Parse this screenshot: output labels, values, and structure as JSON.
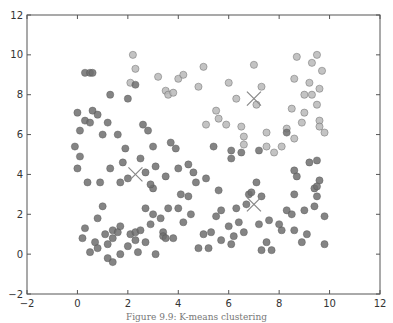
{
  "chart_data": {
    "type": "scatter",
    "title": "",
    "xlabel": "",
    "ylabel": "",
    "xlim": [
      -2,
      12
    ],
    "ylim": [
      -2,
      12
    ],
    "xticks": [
      -2,
      0,
      2,
      4,
      6,
      8,
      10,
      12
    ],
    "yticks": [
      -2,
      0,
      2,
      4,
      6,
      8,
      10,
      12
    ],
    "grid": false,
    "legend": null,
    "series": [
      {
        "name": "cluster-top-right",
        "color": "#b8b8b8",
        "points": [
          [
            2.2,
            10.0
          ],
          [
            2.3,
            9.3
          ],
          [
            2.1,
            8.6
          ],
          [
            3.2,
            8.9
          ],
          [
            3.5,
            8.2
          ],
          [
            3.6,
            8.0
          ],
          [
            4.0,
            8.8
          ],
          [
            4.2,
            9.0
          ],
          [
            3.8,
            8.1
          ],
          [
            5.0,
            9.4
          ],
          [
            4.8,
            8.4
          ],
          [
            5.1,
            6.5
          ],
          [
            5.5,
            7.2
          ],
          [
            5.6,
            6.8
          ],
          [
            5.9,
            6.5
          ],
          [
            6.0,
            8.6
          ],
          [
            6.3,
            7.8
          ],
          [
            6.5,
            6.4
          ],
          [
            6.6,
            5.9
          ],
          [
            6.6,
            5.5
          ],
          [
            7.0,
            9.5
          ],
          [
            7.1,
            7.5
          ],
          [
            7.3,
            8.4
          ],
          [
            7.5,
            6.1
          ],
          [
            7.5,
            5.4
          ],
          [
            7.8,
            5.1
          ],
          [
            8.3,
            6.3
          ],
          [
            8.5,
            7.3
          ],
          [
            8.6,
            8.8
          ],
          [
            8.7,
            9.9
          ],
          [
            8.9,
            6.6
          ],
          [
            9.0,
            8.0
          ],
          [
            9.0,
            7.1
          ],
          [
            9.2,
            8.6
          ],
          [
            9.3,
            9.6
          ],
          [
            9.3,
            8.0
          ],
          [
            9.5,
            7.5
          ],
          [
            9.6,
            8.3
          ],
          [
            9.6,
            6.7
          ],
          [
            9.7,
            9.2
          ],
          [
            9.6,
            6.4
          ],
          [
            9.8,
            6.1
          ],
          [
            8.6,
            5.8
          ],
          [
            8.1,
            5.4
          ],
          [
            9.5,
            10.0
          ]
        ]
      },
      {
        "name": "cluster-bottom-left",
        "color": "#6f6f6f",
        "points": [
          [
            0.3,
            9.1
          ],
          [
            0.5,
            9.1
          ],
          [
            0.6,
            9.1
          ],
          [
            2.3,
            8.5
          ],
          [
            1.3,
            8.0
          ],
          [
            2.0,
            7.8
          ],
          [
            0.0,
            7.1
          ],
          [
            0.6,
            7.2
          ],
          [
            0.8,
            7.0
          ],
          [
            0.3,
            6.7
          ],
          [
            0.5,
            6.6
          ],
          [
            1.2,
            6.6
          ],
          [
            2.6,
            6.5
          ],
          [
            2.8,
            6.2
          ],
          [
            1.0,
            6.0
          ],
          [
            0.1,
            6.2
          ],
          [
            -0.1,
            5.4
          ],
          [
            1.6,
            6.0
          ],
          [
            0.1,
            4.9
          ],
          [
            0.0,
            4.3
          ],
          [
            0.4,
            3.6
          ],
          [
            0.9,
            3.6
          ],
          [
            1.7,
            3.6
          ],
          [
            1.3,
            4.3
          ],
          [
            1.8,
            4.6
          ],
          [
            1.9,
            5.3
          ],
          [
            2.5,
            4.8
          ],
          [
            2.7,
            4.1
          ],
          [
            3.0,
            3.3
          ],
          [
            3.5,
            3.9
          ],
          [
            2.0,
            3.8
          ],
          [
            2.9,
            3.5
          ],
          [
            4.1,
            3.0
          ],
          [
            4.4,
            2.9
          ],
          [
            4.7,
            3.6
          ],
          [
            0.8,
            1.8
          ],
          [
            1.4,
            1.2
          ],
          [
            1.1,
            1.0
          ],
          [
            1.4,
            0.8
          ],
          [
            1.2,
            0.5
          ],
          [
            0.2,
            0.8
          ],
          [
            0.7,
            0.6
          ],
          [
            1.6,
            1.1
          ],
          [
            1.7,
            1.4
          ],
          [
            2.1,
            1.0
          ],
          [
            2.3,
            1.1
          ],
          [
            2.5,
            1.2
          ],
          [
            2.9,
            1.5
          ],
          [
            3.4,
            1.1
          ],
          [
            3.4,
            0.9
          ],
          [
            3.8,
            0.8
          ],
          [
            2.3,
            0.7
          ],
          [
            2.0,
            0.4
          ],
          [
            0.5,
            0.1
          ],
          [
            1.7,
            0.0
          ],
          [
            1.2,
            -0.2
          ],
          [
            1.4,
            -0.4
          ],
          [
            2.4,
            0.1
          ],
          [
            2.7,
            0.6
          ],
          [
            0.8,
            0.3
          ],
          [
            3.1,
            0.0
          ],
          [
            3.5,
            0.8
          ],
          [
            4.2,
            1.6
          ],
          [
            3.0,
            2.0
          ],
          [
            3.6,
            2.3
          ],
          [
            4.0,
            2.3
          ],
          [
            3.3,
            1.8
          ],
          [
            3.1,
            4.4
          ],
          [
            3.7,
            5.6
          ],
          [
            4.4,
            4.5
          ],
          [
            4.6,
            4.1
          ],
          [
            5.1,
            3.8
          ],
          [
            4.5,
            2.0
          ],
          [
            3.9,
            5.3
          ],
          [
            5.4,
            5.4
          ],
          [
            5.0,
            1.0
          ],
          [
            5.3,
            1.1
          ],
          [
            5.7,
            0.7
          ],
          [
            4.0,
            4.3
          ],
          [
            3.0,
            5.4
          ],
          [
            2.7,
            2.3
          ],
          [
            1.0,
            2.4
          ],
          [
            0.3,
            1.3
          ],
          [
            4.8,
            0.3
          ],
          [
            5.2,
            0.3
          ]
        ]
      },
      {
        "name": "cluster-bottom-right",
        "color": "#6f6f6f",
        "points": [
          [
            6.1,
            5.2
          ],
          [
            6.1,
            4.8
          ],
          [
            6.5,
            5.1
          ],
          [
            7.2,
            5.2
          ],
          [
            8.3,
            6.1
          ],
          [
            8.6,
            4.2
          ],
          [
            8.7,
            3.9
          ],
          [
            9.2,
            4.6
          ],
          [
            9.5,
            4.7
          ],
          [
            9.6,
            3.7
          ],
          [
            9.4,
            3.3
          ],
          [
            9.5,
            2.9
          ],
          [
            8.6,
            3.0
          ],
          [
            8.3,
            2.2
          ],
          [
            8.5,
            2.0
          ],
          [
            9.0,
            2.2
          ],
          [
            8.1,
            1.2
          ],
          [
            8.6,
            1.2
          ],
          [
            8.9,
            0.6
          ],
          [
            9.1,
            1.0
          ],
          [
            9.8,
            1.9
          ],
          [
            9.8,
            0.5
          ],
          [
            7.5,
            0.6
          ],
          [
            7.7,
            0.2
          ],
          [
            7.3,
            0.2
          ],
          [
            6.8,
            3.0
          ],
          [
            6.7,
            2.5
          ],
          [
            6.9,
            3.1
          ],
          [
            7.1,
            3.6
          ],
          [
            7.3,
            2.9
          ],
          [
            6.3,
            2.3
          ],
          [
            6.4,
            1.6
          ],
          [
            6.6,
            1.1
          ],
          [
            6.0,
            1.4
          ],
          [
            6.1,
            0.5
          ],
          [
            5.7,
            2.2
          ],
          [
            5.5,
            1.9
          ],
          [
            6.2,
            0.9
          ],
          [
            5.6,
            3.2
          ],
          [
            7.6,
            1.7
          ],
          [
            7.2,
            1.5
          ],
          [
            8.0,
            1.5
          ],
          [
            9.5,
            3.4
          ],
          [
            9.4,
            2.4
          ]
        ]
      }
    ],
    "centroids": [
      {
        "x": 7.0,
        "y": 7.8,
        "marker": "x"
      },
      {
        "x": 2.3,
        "y": 4.0,
        "marker": "x"
      },
      {
        "x": 7.0,
        "y": 2.5,
        "marker": "x"
      }
    ]
  },
  "caption": "Figure 9.9: K-means clustering"
}
